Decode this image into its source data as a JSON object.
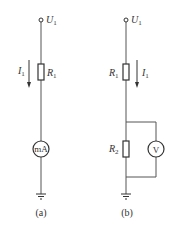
{
  "circuits": [
    {
      "id": "a",
      "caption": "(a)",
      "terminal": {
        "label": "U",
        "subscript": "1"
      },
      "resistor": {
        "label": "R",
        "subscript": "1"
      },
      "current": {
        "label": "I",
        "subscript": "1",
        "direction": "down",
        "side": "left"
      },
      "meter": {
        "label": "mA",
        "type": "milliammeter",
        "connection": "series"
      },
      "ground": true
    },
    {
      "id": "b",
      "caption": "(b)",
      "terminal": {
        "label": "U",
        "subscript": "1"
      },
      "resistor_top": {
        "label": "R",
        "subscript": "1"
      },
      "current": {
        "label": "I",
        "subscript": "1",
        "direction": "down",
        "side": "right"
      },
      "resistor_bottom": {
        "label": "R",
        "subscript": "2"
      },
      "meter": {
        "label": "V",
        "type": "voltmeter",
        "connection": "parallel with R2"
      },
      "ground": true
    }
  ],
  "colors": {
    "wire": "#555555",
    "component": "#333333",
    "background": "#ffffff"
  }
}
